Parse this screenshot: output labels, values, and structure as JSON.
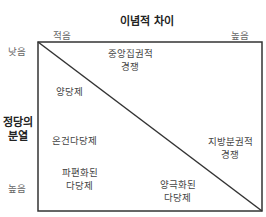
{
  "x_axis": {
    "title": "이념적 차이",
    "low_label": "적음",
    "high_label": "높음"
  },
  "y_axis": {
    "title_line1": "정당의",
    "title_line2": "분열",
    "low_label": "낮음",
    "high_label": "높음"
  },
  "regions": {
    "central_competition": {
      "line1": "중앙집권적",
      "line2": "경쟁"
    },
    "two_party": {
      "line1": "양당제"
    },
    "moderate_multiparty": {
      "line1": "온건다당제"
    },
    "fragmented_multiparty": {
      "line1": "파편화된",
      "line2": "다당제"
    },
    "decentralized_competition": {
      "line1": "지방분권적",
      "line2": "경쟁"
    },
    "polarized_multiparty": {
      "line1": "양극화된",
      "line2": "다당제"
    }
  }
}
